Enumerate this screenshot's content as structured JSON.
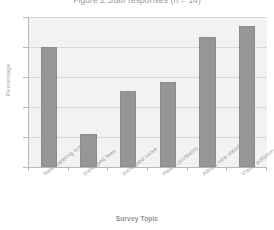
{
  "chart_data": {
    "type": "bar",
    "title": "Figure 2 Staff responses (n = 14)",
    "xlabel": "Survey Topic",
    "ylabel": "Percentage",
    "categories": [
      "New watering system",
      "Increased fees",
      "Increased noise",
      "Health problems",
      "Attract new members",
      "Visual pollution"
    ],
    "values": [
      80,
      22,
      51,
      57,
      87,
      94
    ],
    "ylim": [
      0,
      100
    ],
    "yticks": [
      0,
      20,
      40,
      60,
      80,
      100
    ],
    "ytick_labels": [
      "0",
      "20",
      "40",
      "60",
      "80",
      "100"
    ],
    "grid": true,
    "legend": false,
    "bar_color": "#969696",
    "plot_background": "#f2f2f2",
    "gridline_color": "#d9d9d9",
    "axis_color": "#b9b9b9"
  }
}
